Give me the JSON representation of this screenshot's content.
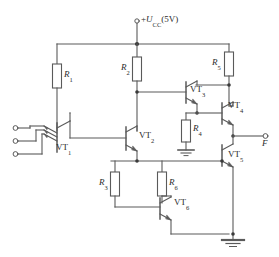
{
  "diagram": {
    "type": "circuit-schematic",
    "stroke_color": "#555555",
    "text_color": "#2b2b2b",
    "background": "#ffffff",
    "power_rail": {
      "label_prefix": "+",
      "label_symbol": "U",
      "label_subscript": "CC",
      "label_value": "(5V)",
      "full_label": "+UCC(5V)",
      "terminal": "open-circle"
    },
    "output": {
      "label": "F",
      "terminal": "open-circle"
    },
    "inputs": [
      {
        "name": "input-terminal-1",
        "terminal": "open-circle"
      },
      {
        "name": "input-terminal-2",
        "terminal": "open-circle"
      },
      {
        "name": "input-terminal-3",
        "terminal": "open-circle"
      }
    ],
    "resistors": [
      {
        "id": "R1",
        "symbol": "R",
        "subscript": "1",
        "orientation": "vertical"
      },
      {
        "id": "R2",
        "symbol": "R",
        "subscript": "2",
        "orientation": "vertical"
      },
      {
        "id": "R3",
        "symbol": "R",
        "subscript": "3",
        "orientation": "vertical"
      },
      {
        "id": "R4",
        "symbol": "R",
        "subscript": "4",
        "orientation": "vertical"
      },
      {
        "id": "R5",
        "symbol": "R",
        "subscript": "5",
        "orientation": "vertical"
      },
      {
        "id": "R6",
        "symbol": "R",
        "subscript": "6",
        "orientation": "vertical"
      }
    ],
    "transistors": [
      {
        "id": "VT1",
        "symbol": "VT",
        "subscript": "1",
        "kind": "multi-emitter-npn"
      },
      {
        "id": "VT2",
        "symbol": "VT",
        "subscript": "2",
        "kind": "npn"
      },
      {
        "id": "VT3",
        "symbol": "VT",
        "subscript": "3",
        "kind": "npn"
      },
      {
        "id": "VT4",
        "symbol": "VT",
        "subscript": "4",
        "kind": "npn"
      },
      {
        "id": "VT5",
        "symbol": "VT",
        "subscript": "5",
        "kind": "npn"
      },
      {
        "id": "VT6",
        "symbol": "VT",
        "subscript": "6",
        "kind": "npn"
      }
    ],
    "grounds": [
      {
        "name": "ground-r4"
      },
      {
        "name": "ground-main"
      }
    ]
  }
}
